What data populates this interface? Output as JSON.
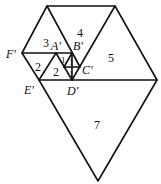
{
  "diagram": {
    "vertex_labels": {
      "F": "F'",
      "A": "A'",
      "B": "B'",
      "C": "C'",
      "D": "D'",
      "E": "E'"
    },
    "region_labels": {
      "r3": "3",
      "r4": "4",
      "r5": "5",
      "r7": "7",
      "r2a": "2",
      "r2b": "2",
      "r1a": "1",
      "r1b": "1",
      "r1c": "1"
    }
  }
}
